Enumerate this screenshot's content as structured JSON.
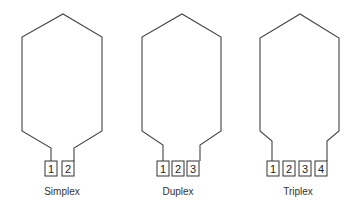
{
  "diagrams": [
    {
      "name": "Simplex",
      "label": "Simplex",
      "boxes": [
        "1",
        "2"
      ]
    },
    {
      "name": "Duplex",
      "label": "Duplex",
      "boxes": [
        "1",
        "2",
        "3"
      ]
    },
    {
      "name": "Triplex",
      "label": "Triplex",
      "boxes": [
        "1",
        "2",
        "3",
        "4"
      ]
    }
  ],
  "colors": {
    "line": "#444444",
    "background": "#ffffff"
  }
}
